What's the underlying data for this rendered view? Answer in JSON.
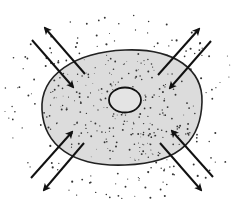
{
  "diagram": {
    "colors": {
      "background": "#ffffff",
      "cell_fill": "#dcdcdc",
      "outline": "#222222",
      "particles": "#333333",
      "arrows": "#111111"
    },
    "cell": {
      "cx": 121,
      "cy": 108,
      "rx": 81,
      "ry": 58
    },
    "nucleus": {
      "cx": 125,
      "cy": 100,
      "rx": 16,
      "ry": 13
    },
    "arrows": [
      {
        "name": "top-left-out",
        "x1": 85,
        "y1": 74,
        "x2": 45,
        "y2": 28
      },
      {
        "name": "top-left-in",
        "x1": 32,
        "y1": 40,
        "x2": 73,
        "y2": 87
      },
      {
        "name": "top-right-out",
        "x1": 158,
        "y1": 75,
        "x2": 199,
        "y2": 29
      },
      {
        "name": "top-right-in",
        "x1": 211,
        "y1": 41,
        "x2": 170,
        "y2": 88
      },
      {
        "name": "bottom-left-in",
        "x1": 31,
        "y1": 178,
        "x2": 72,
        "y2": 132
      },
      {
        "name": "bottom-left-out",
        "x1": 84,
        "y1": 143,
        "x2": 44,
        "y2": 190
      },
      {
        "name": "bottom-right-in",
        "x1": 213,
        "y1": 177,
        "x2": 172,
        "y2": 131
      },
      {
        "name": "bottom-right-out",
        "x1": 160,
        "y1": 143,
        "x2": 201,
        "y2": 190
      }
    ]
  }
}
